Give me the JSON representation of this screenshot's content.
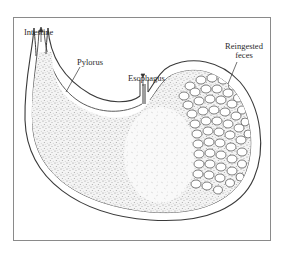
{
  "figure": {
    "type": "anatomical-illustration",
    "labels": {
      "intestine": "Intestine",
      "pylorus": "Pylorus",
      "esophagus": "Esophagus",
      "reingested_feces_line1": "Reingested",
      "reingested_feces_line2": "feces"
    },
    "colors": {
      "background": "#ffffff",
      "outline": "#3a3a3a",
      "frame": "#8a8a8a",
      "stipple": "#9a9a9a",
      "pellet_fill": "#ffffff",
      "pellet_stroke": "#4a4a4a"
    }
  }
}
